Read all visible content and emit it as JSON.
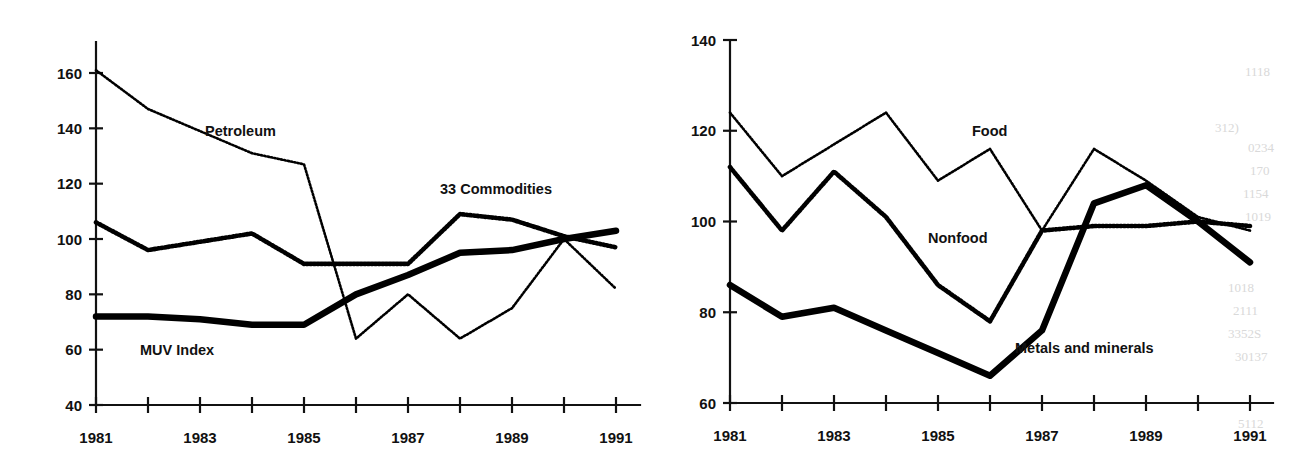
{
  "figure": {
    "panels": [
      {
        "id": "left",
        "axis": {
          "ylim": [
            40,
            160
          ],
          "yticks": [
            40,
            60,
            80,
            100,
            120,
            140,
            160
          ],
          "ytick_labels": [
            "40",
            "60",
            "80",
            "100",
            "120",
            "140",
            "160"
          ],
          "xlim": [
            1981,
            1991
          ],
          "xticks": [
            1981,
            1982,
            1983,
            1984,
            1985,
            1986,
            1987,
            1988,
            1989,
            1990,
            1991
          ],
          "xtick_labels_shown": [
            "1981",
            "1983",
            "1985",
            "1987",
            "1989",
            "1991"
          ],
          "grid": false
        },
        "annotations": [
          {
            "name": "petroleum-label",
            "text": "Petroleum"
          },
          {
            "name": "commodities-label",
            "text": "33 Commodities"
          },
          {
            "name": "muv-label",
            "text": "MUV Index"
          }
        ]
      },
      {
        "id": "right",
        "axis": {
          "ylim": [
            60,
            140
          ],
          "yticks": [
            60,
            80,
            100,
            120,
            140
          ],
          "ytick_labels": [
            "60",
            "80",
            "100",
            "120",
            "140"
          ],
          "xlim": [
            1981,
            1991
          ],
          "xticks": [
            1981,
            1982,
            1983,
            1984,
            1985,
            1986,
            1987,
            1988,
            1989,
            1990,
            1991
          ],
          "xtick_labels_shown": [
            "1981",
            "1983",
            "1985",
            "1987",
            "1989",
            "1991"
          ],
          "grid": false
        },
        "annotations": [
          {
            "name": "food-label",
            "text": "Food"
          },
          {
            "name": "nonfood-label",
            "text": "Nonfood"
          },
          {
            "name": "metals-label",
            "text": "Metals and minerals"
          }
        ]
      }
    ],
    "bleed_through": [
      "1118",
      "312)",
      "0234",
      "170",
      "1154",
      "1019",
      "1018",
      "2111",
      "3352S",
      "30137",
      "5112",
      "1010"
    ]
  },
  "chart_data": [
    {
      "type": "line",
      "title": "",
      "subtitle": "",
      "xlabel": "",
      "ylabel": "",
      "x": [
        1981,
        1982,
        1983,
        1984,
        1985,
        1986,
        1987,
        1988,
        1989,
        1990,
        1991
      ],
      "xlim": [
        1981,
        1991
      ],
      "ylim": [
        40,
        160
      ],
      "yticks": [
        40,
        60,
        80,
        100,
        120,
        140,
        160
      ],
      "grid": false,
      "legend": "inline-annotations",
      "series": [
        {
          "name": "Petroleum",
          "style": "fine-dotted",
          "values": [
            161,
            147,
            139,
            131,
            127,
            64,
            80,
            64,
            75,
            100,
            82
          ]
        },
        {
          "name": "33 Commodities",
          "style": "diamond-dotted",
          "values": [
            106,
            96,
            99,
            102,
            91,
            91,
            91,
            109,
            107,
            101,
            97
          ]
        },
        {
          "name": "MUV Index",
          "style": "thick-solid",
          "values": [
            72,
            72,
            71,
            69,
            69,
            80,
            87,
            95,
            96,
            100,
            103
          ]
        }
      ]
    },
    {
      "type": "line",
      "title": "",
      "subtitle": "",
      "xlabel": "",
      "ylabel": "",
      "x": [
        1981,
        1982,
        1983,
        1984,
        1985,
        1986,
        1987,
        1988,
        1989,
        1990,
        1991
      ],
      "xlim": [
        1981,
        1991
      ],
      "ylim": [
        60,
        140
      ],
      "yticks": [
        60,
        80,
        100,
        120,
        140
      ],
      "grid": false,
      "legend": "inline-annotations",
      "series": [
        {
          "name": "Food",
          "style": "fine-dotted",
          "values": [
            124,
            110,
            117,
            124,
            109,
            116,
            98,
            116,
            109,
            101,
            98
          ]
        },
        {
          "name": "Nonfood",
          "style": "diamond-dotted",
          "values": [
            112,
            98,
            111,
            101,
            86,
            78,
            98,
            99,
            99,
            100,
            99
          ]
        },
        {
          "name": "Metals and minerals",
          "style": "thick-solid",
          "values": [
            86,
            79,
            81,
            76,
            71,
            66,
            76,
            104,
            108,
            100,
            91
          ]
        }
      ]
    }
  ]
}
